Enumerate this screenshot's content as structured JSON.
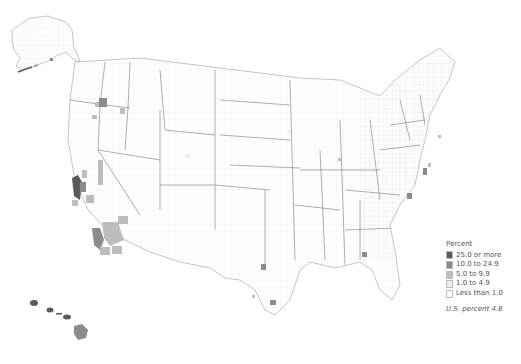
{
  "legend": {
    "title": "Percent",
    "classes": [
      {
        "label": "25.0 or more",
        "color": "#5a5a5a"
      },
      {
        "label": "10.0 to 24.9",
        "color": "#8c8c8c"
      },
      {
        "label": "5.0 to 9.9",
        "color": "#bdbdbd"
      },
      {
        "label": "1.0 to 4.9",
        "color": "#ececec"
      },
      {
        "label": "Less than 1.0",
        "color": "#ffffff"
      }
    ],
    "note": "U.S. percent 4.8"
  },
  "colors": {
    "c25": "#5a5a5a",
    "c10": "#8c8c8c",
    "c5": "#bdbdbd",
    "c1": "#ececec",
    "border": "#9a9a9a"
  }
}
